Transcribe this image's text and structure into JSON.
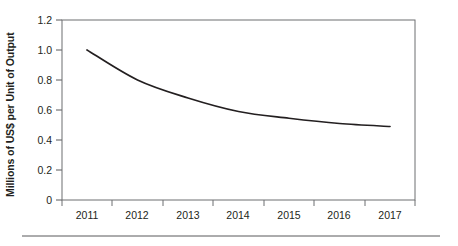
{
  "chart_data": {
    "type": "line",
    "title": "",
    "xlabel": "",
    "ylabel": "Millions of US$ per Unit of Output",
    "categories": [
      "2011",
      "2012",
      "2013",
      "2014",
      "2015",
      "2016",
      "2017"
    ],
    "x": [
      2011,
      2012,
      2013,
      2014,
      2015,
      2016,
      2017
    ],
    "values": [
      1.0,
      0.8,
      0.68,
      0.59,
      0.545,
      0.51,
      0.49
    ],
    "series": [
      {
        "name": "Cost per Unit of Output",
        "values": [
          1.0,
          0.8,
          0.68,
          0.59,
          0.545,
          0.51,
          0.49
        ]
      }
    ],
    "ylim": [
      0,
      1.2
    ],
    "yticks": [
      "0",
      "0.2",
      "0.4",
      "0.6",
      "0.8",
      "1.0",
      "1.2"
    ],
    "ytick_values": [
      0,
      0.2,
      0.4,
      0.6,
      0.8,
      1.0,
      1.2
    ],
    "xticks": [
      "2011",
      "2012",
      "2013",
      "2014",
      "2015",
      "2016",
      "2017"
    ],
    "grid": false,
    "legend": "none",
    "line_color": "#231f20",
    "axis_color": "#58595b",
    "frame": "full-box"
  },
  "figure": {
    "y_axis_title": "Millions of US$ per Unit of Output",
    "footer_rule": true
  }
}
